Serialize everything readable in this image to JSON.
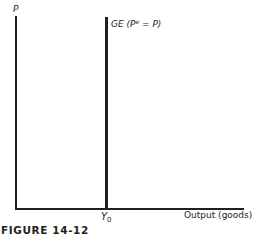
{
  "diagram": {
    "y_axis_label": "P",
    "x_axis_label": "Output (goods)",
    "curve": {
      "name": "GE",
      "label_prefix": "GE (P",
      "label_sup": "e",
      "label_suffix": " = P)",
      "type": "vertical",
      "x_position_label": "Y",
      "x_position_sub": "0"
    },
    "caption": "FIGURE 14-12"
  },
  "colors": {
    "ink": "#231f20",
    "background": "#ffffff"
  }
}
